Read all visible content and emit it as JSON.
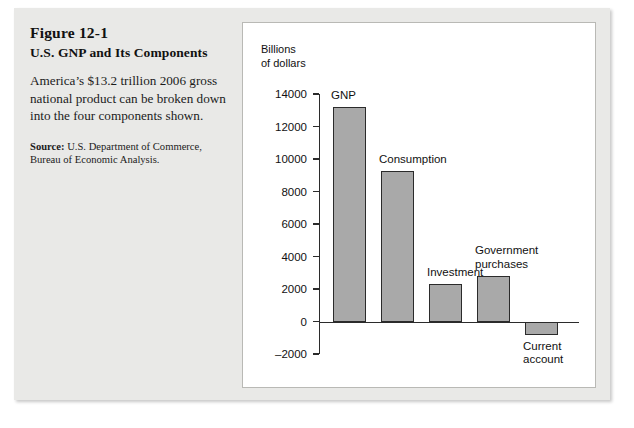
{
  "figure": {
    "number": "Figure 12-1",
    "title": "U.S. GNP and Its Components",
    "description": "America’s $13.2 trillion 2006 gross national product can be broken down into the four components shown.",
    "source_label": "Source:",
    "source_text": " U.S. Department of Commerce, Bureau of Economic Analysis."
  },
  "chart_data": {
    "type": "bar",
    "title": "",
    "xlabel": "",
    "ylabel": "Billions\nof dollars",
    "categories": [
      "GNP",
      "Consumption",
      "Investment",
      "Government\npurchases",
      "Current\naccount"
    ],
    "values": [
      13200,
      9250,
      2300,
      2800,
      -800
    ],
    "ylim": [
      -2000,
      14000
    ],
    "yticks": [
      14000,
      12000,
      10000,
      8000,
      6000,
      4000,
      2000,
      0,
      -2000
    ],
    "ytick_labels": [
      "14000",
      "12000",
      "10000",
      "8000",
      "6000",
      "4000",
      "2000",
      "0",
      "–2000"
    ],
    "grid": false,
    "legend": "none",
    "bar_color": "#a9a9a9",
    "bar_edge_color": "#2b2b2b",
    "label_positions": [
      "above",
      "above",
      "above",
      "above",
      "below"
    ]
  }
}
